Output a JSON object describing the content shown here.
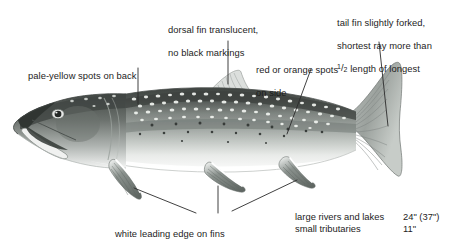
{
  "figure": {
    "background_color": "#ffffff",
    "text_color": "#1d1d1d",
    "leader_line_color": "#2b2b2b"
  },
  "callouts": {
    "back_spots": {
      "text": "pale-yellow spots on back",
      "x": 28,
      "y": 58
    },
    "dorsal_fin": {
      "line1": "dorsal fin translucent,",
      "line2": "no black markings",
      "x": 168,
      "y": 12
    },
    "side_spots": {
      "line1": "red or orange spots",
      "line2": "on side",
      "x": 256,
      "y": 52
    },
    "tail_fin": {
      "line1": "tail fin slightly forked,",
      "line2": "shortest ray more than",
      "line3_prefix": "",
      "fraction_numerator": "1",
      "fraction_slash": "/",
      "fraction_denominator": "2",
      "line3_suffix": " length of longest",
      "x": 337,
      "y": 5
    },
    "fin_edges": {
      "text": "white leading edge on fins",
      "x": 115,
      "y": 216
    }
  },
  "size_table": {
    "x": 295,
    "y": 211,
    "rows": [
      {
        "habitat": "large rivers and lakes",
        "length": "24\" (37\")"
      },
      {
        "habitat": "small tributaries",
        "length": "11\""
      }
    ]
  },
  "fish_art": {
    "body_dark_back": "#4a4f4c",
    "body_mid": "#8d9490",
    "body_light": "#c8cdc9",
    "belly": "#fdfdfd",
    "fin_gray": "#9aa09c",
    "outline": "#5a5f5c",
    "spot_light": "#eef0ec",
    "spot_dark": "#3a3e3b"
  }
}
